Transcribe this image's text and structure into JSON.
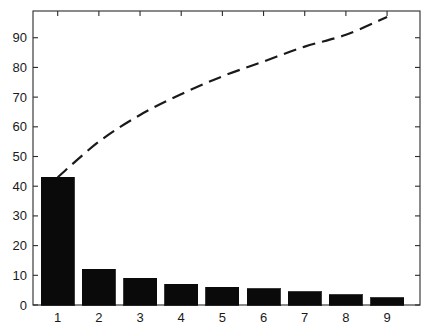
{
  "chart_data": {
    "type": "bar",
    "title": "",
    "subtitle": "",
    "xlabel": "",
    "ylabel": "",
    "categories": [
      "1",
      "2",
      "3",
      "4",
      "5",
      "6",
      "7",
      "8",
      "9"
    ],
    "values": [
      43,
      12,
      9,
      7,
      6,
      5.5,
      4.5,
      3.5,
      2.5
    ],
    "series": [
      {
        "name": "Frequency",
        "type": "bar",
        "values": [
          43,
          12,
          9,
          7,
          6,
          5.5,
          4.5,
          3.5,
          2.5
        ]
      },
      {
        "name": "Cumulative",
        "type": "line",
        "style": "dashed",
        "values": [
          43,
          55,
          64,
          71,
          77,
          82,
          87,
          91,
          97
        ]
      }
    ],
    "ylim": [
      0,
      99
    ],
    "xlim": [
      0.4,
      9.8
    ],
    "yticks": [
      0,
      10,
      20,
      30,
      40,
      50,
      60,
      70,
      80,
      90
    ],
    "ytick_labels": [
      "0",
      "10",
      "20",
      "30",
      "40",
      "50",
      "60",
      "70",
      "80",
      "90"
    ],
    "xticks": [
      1,
      2,
      3,
      4,
      5,
      6,
      7,
      8,
      9
    ],
    "xtick_labels": [
      "1",
      "2",
      "3",
      "4",
      "5",
      "6",
      "7",
      "8",
      "9"
    ],
    "grid": false,
    "legend": null,
    "legend_position": "none",
    "annotations": [],
    "colors": {
      "bar_fill": "#0a0a0a",
      "bar_edge": "#0a0a0a",
      "line": "#1a1a1a",
      "axis": "#2b2b2b",
      "background": "#ffffff",
      "tick_text": "#1a1a1a"
    }
  }
}
